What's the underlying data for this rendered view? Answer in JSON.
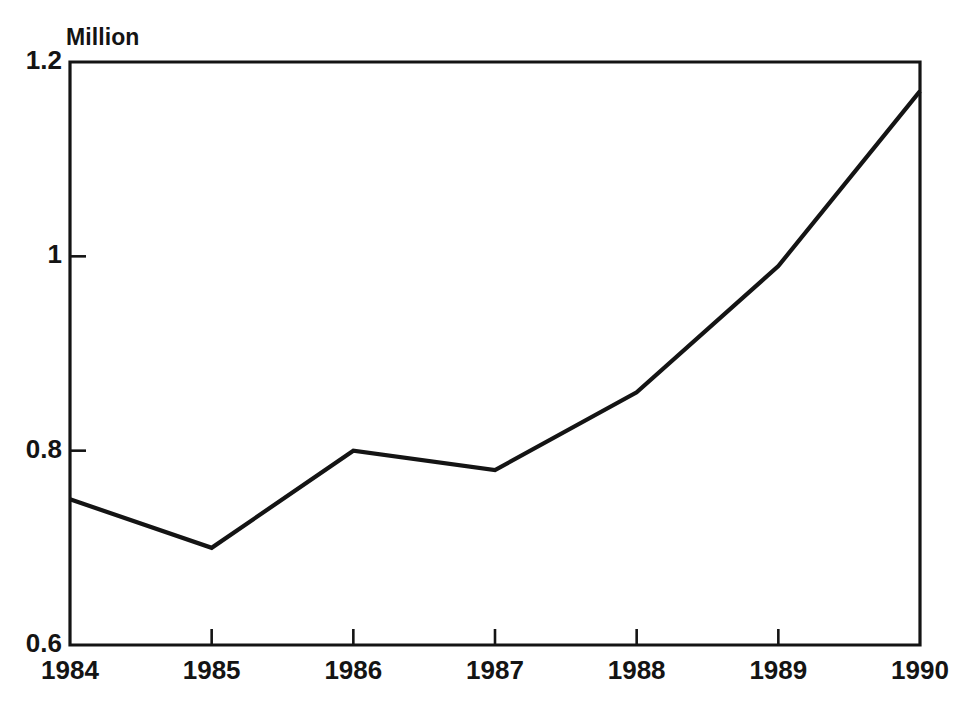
{
  "chart_data": {
    "type": "line",
    "title": "",
    "subtitle": "",
    "unit_label": "Million",
    "xlabel": "",
    "ylabel": "Million",
    "categories": [
      "1984",
      "1985",
      "1986",
      "1987",
      "1988",
      "1989",
      "1990"
    ],
    "x": [
      1984,
      1985,
      1986,
      1987,
      1988,
      1989,
      1990
    ],
    "values": [
      0.75,
      0.7,
      0.8,
      0.78,
      0.86,
      0.99,
      1.17
    ],
    "series": [
      {
        "name": "",
        "values": [
          0.75,
          0.7,
          0.8,
          0.78,
          0.86,
          0.99,
          1.17
        ]
      }
    ],
    "ylim": [
      0.6,
      1.2
    ],
    "xlim": [
      1984,
      1990
    ],
    "ytick_labels": [
      "1.2",
      "1",
      "0.8",
      "0.6"
    ],
    "ytick_values": [
      1.2,
      1.0,
      0.8,
      0.6
    ],
    "xtick_labels": [
      "1984",
      "1985",
      "1986",
      "1987",
      "1988",
      "1989",
      "1990"
    ],
    "grid": false,
    "legend": false,
    "legend_position": "none",
    "line_color": "#141414",
    "background_color": "#ffffff",
    "annotations": []
  },
  "axes": {
    "unit_caption": "Million"
  }
}
